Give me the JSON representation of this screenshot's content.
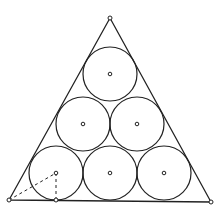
{
  "diagram": {
    "title": "",
    "stroke_color": "#222222",
    "background_color": "#ffffff",
    "triangle": {
      "vertices": [
        {
          "name": "bottom-left",
          "x": 9,
          "y": 200
        },
        {
          "name": "bottom-right",
          "x": 211,
          "y": 202
        },
        {
          "name": "apex",
          "x": 110,
          "y": 18
        }
      ]
    },
    "circle_radius": 27,
    "circles": [
      {
        "row": "top",
        "cx": 110,
        "cy": 74
      },
      {
        "row": "middle",
        "cx": 83,
        "cy": 124
      },
      {
        "row": "middle",
        "cx": 137,
        "cy": 124
      },
      {
        "row": "bottom",
        "cx": 56,
        "cy": 173
      },
      {
        "row": "bottom",
        "cx": 110,
        "cy": 173
      },
      {
        "row": "bottom",
        "cx": 164,
        "cy": 173
      }
    ],
    "construction_lines": [
      {
        "name": "vertex-to-center",
        "x1": 9,
        "y1": 200,
        "x2": 56,
        "y2": 173,
        "dashed": true
      },
      {
        "name": "center-to-tangent",
        "x1": 56,
        "y1": 173,
        "x2": 56,
        "y2": 200,
        "dashed": true
      }
    ],
    "marked_points": [
      {
        "name": "apex-point",
        "x": 110,
        "y": 18
      },
      {
        "name": "bottom-left-point",
        "x": 9,
        "y": 200
      },
      {
        "name": "bottom-right-point",
        "x": 211,
        "y": 202
      },
      {
        "name": "tangent-point",
        "x": 56,
        "y": 200
      }
    ]
  }
}
